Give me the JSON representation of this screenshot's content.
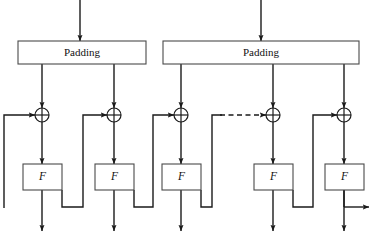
{
  "figure": {
    "kind": "block-diagram",
    "title": "",
    "canvas": {
      "width": 373,
      "height": 236
    },
    "background_color": "#ffffff",
    "line_color": "#1a1a1a",
    "box_stroke_color": "#4a4a4a",
    "box_fill_color": "#ffffff"
  },
  "padding_blocks": [
    {
      "id": "padding-left",
      "label": "Padding",
      "x": 18,
      "y": 41,
      "width": 128,
      "height": 23,
      "label_x": 82,
      "label_y": 53
    },
    {
      "id": "padding-right",
      "label": "Padding",
      "x": 163,
      "y": 41,
      "width": 196,
      "height": 23,
      "label_x": 261,
      "label_y": 53
    }
  ],
  "input_arrows": [
    {
      "id": "input-arrow-left",
      "x": 80,
      "y_start": 0,
      "y_end": 41
    },
    {
      "id": "input-arrow-right",
      "x": 261,
      "y_start": 0,
      "y_end": 41
    }
  ],
  "xor_nodes": [
    {
      "id": "xor-1",
      "cx": 42,
      "cy": 115,
      "r": 7,
      "symbol": "xor"
    },
    {
      "id": "xor-2",
      "cx": 114,
      "cy": 115,
      "r": 7,
      "symbol": "xor"
    },
    {
      "id": "xor-3",
      "cx": 181,
      "cy": 115,
      "r": 7,
      "symbol": "xor"
    },
    {
      "id": "xor-4",
      "cx": 273,
      "cy": 115,
      "r": 7,
      "symbol": "xor"
    },
    {
      "id": "xor-5",
      "cx": 344,
      "cy": 115,
      "r": 7,
      "symbol": "xor"
    }
  ],
  "f_blocks": [
    {
      "id": "f-1",
      "label": "F",
      "x": 23,
      "y": 164,
      "width": 39,
      "height": 26,
      "label_x": 42.5,
      "label_y": 177
    },
    {
      "id": "f-2",
      "label": "F",
      "x": 95,
      "y": 164,
      "width": 39,
      "height": 26,
      "label_x": 114.5,
      "label_y": 177
    },
    {
      "id": "f-3",
      "label": "F",
      "x": 162,
      "y": 164,
      "width": 39,
      "height": 26,
      "label_x": 181.5,
      "label_y": 177
    },
    {
      "id": "f-4",
      "label": "F",
      "x": 254,
      "y": 164,
      "width": 39,
      "height": 26,
      "label_x": 273.5,
      "label_y": 177
    },
    {
      "id": "f-5",
      "label": "F",
      "x": 325,
      "y": 164,
      "width": 39,
      "height": 26,
      "label_x": 344.5,
      "label_y": 177
    }
  ],
  "padding_taps": [
    {
      "id": "tap-left-1",
      "x": 42,
      "y_start": 64,
      "y_end": 108
    },
    {
      "id": "tap-left-2",
      "x": 114,
      "y_start": 64,
      "y_end": 108
    },
    {
      "id": "tap-right-1",
      "x": 181,
      "y_start": 64,
      "y_end": 108
    },
    {
      "id": "tap-right-2",
      "x": 273,
      "y_start": 64,
      "y_end": 108
    },
    {
      "id": "tap-right-3",
      "x": 344,
      "y_start": 64,
      "y_end": 108
    }
  ],
  "xor_to_f_arrows": [
    {
      "id": "xor-to-f-1",
      "x": 42,
      "y_start": 122,
      "y_end": 164
    },
    {
      "id": "xor-to-f-2",
      "x": 114,
      "y_start": 122,
      "y_end": 164
    },
    {
      "id": "xor-to-f-3",
      "x": 181,
      "y_start": 122,
      "y_end": 164
    },
    {
      "id": "xor-to-f-4",
      "x": 273,
      "y_start": 122,
      "y_end": 164
    },
    {
      "id": "xor-to-f-5",
      "x": 344,
      "y_start": 122,
      "y_end": 164
    }
  ],
  "f_output_arrows": [
    {
      "id": "f-out-1",
      "x": 42,
      "y_start": 190,
      "y_end": 231
    },
    {
      "id": "f-out-2",
      "x": 114,
      "y_start": 190,
      "y_end": 231
    },
    {
      "id": "f-out-3",
      "x": 181,
      "y_start": 190,
      "y_end": 231
    },
    {
      "id": "f-out-4",
      "x": 273,
      "y_start": 190,
      "y_end": 231
    },
    {
      "id": "f-out-5",
      "x": 344,
      "y_start": 190,
      "y_end": 231
    }
  ],
  "feedback_paths": [
    {
      "id": "feedback-initial-iv",
      "note": "leftmost vertical rail feeding first XOR",
      "points": "4,208 4,115 35,115",
      "arrow": true,
      "dashed": false
    },
    {
      "id": "feedback-1-to-2",
      "note": "stage 1 F output routed right into XOR 2",
      "points": "62,190 62,207 83,207 83,115 107,115",
      "arrow": true,
      "dashed": false
    },
    {
      "id": "feedback-2-to-3",
      "note": "stage 2 F output routed right into XOR 3",
      "points": "134,190 134,207 153,207 153,115 174,115",
      "arrow": true,
      "dashed": false
    },
    {
      "id": "feedback-3-to-gap",
      "note": "stage 3 F output routed right to dashed continuation",
      "points": "201,190 201,207 212,207 212,115 222,115",
      "arrow": false,
      "dashed": false
    },
    {
      "id": "feedback-gap-dashed",
      "note": "dashed ellipsis link into XOR 4",
      "points": "220,115 266,115",
      "arrow": true,
      "dashed": true
    },
    {
      "id": "feedback-4-to-5",
      "note": "stage 4 F output routed right into XOR 5",
      "points": "293,190 293,207 313,207 313,115 337,115",
      "arrow": true,
      "dashed": false
    },
    {
      "id": "output-right",
      "note": "final stage output arrow exiting to the right",
      "points": "344,207 369,207",
      "arrow": true,
      "dashed": false
    }
  ],
  "bottom_rail_stubs": [
    {
      "id": "rail-stub-5",
      "x": 344,
      "y_start": 190,
      "y_end": 207
    }
  ]
}
